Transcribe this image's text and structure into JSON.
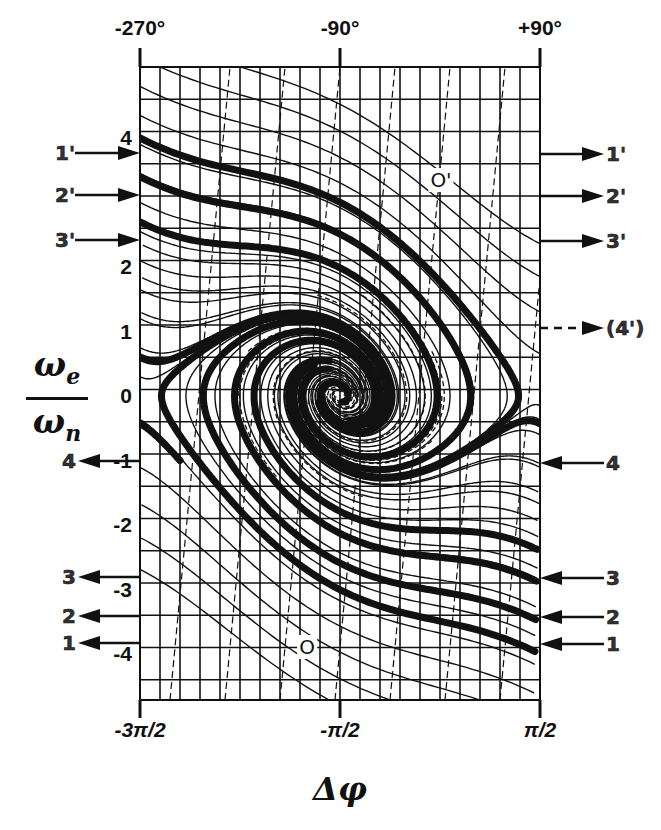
{
  "figure": {
    "y_axis_label": {
      "numerator": "ω",
      "numerator_sub": "e",
      "denominator": "ω",
      "denominator_sub": "n"
    },
    "x_axis_label": "Δφ",
    "x_ticks_top": [
      {
        "label": "-270°",
        "x": 140
      },
      {
        "label": "-90°",
        "x": 340
      },
      {
        "label": "+90°",
        "x": 540
      }
    ],
    "x_ticks_bottom": [
      {
        "label": "-3π/2",
        "x": 140
      },
      {
        "label": "-π/2",
        "x": 340
      },
      {
        "label": "π/2",
        "x": 540
      }
    ],
    "y_ticks": [
      {
        "label": "4",
        "value": 4
      },
      {
        "label": "2",
        "value": 2
      },
      {
        "label": "1",
        "value": 1
      },
      {
        "label": "0",
        "value": 0
      },
      {
        "label": "-1",
        "value": -1
      },
      {
        "label": "-2",
        "value": -2
      },
      {
        "label": "-3",
        "value": -3
      },
      {
        "label": "-4",
        "value": -4
      }
    ],
    "left_arrows": [
      {
        "label": "1'",
        "y": 153,
        "direction": "in"
      },
      {
        "label": "2'",
        "y": 195,
        "direction": "in"
      },
      {
        "label": "3'",
        "y": 240,
        "direction": "in"
      },
      {
        "label": "4",
        "y": 461,
        "direction": "out"
      },
      {
        "label": "3",
        "y": 577,
        "direction": "out"
      },
      {
        "label": "2",
        "y": 616,
        "direction": "out"
      },
      {
        "label": "1",
        "y": 643,
        "direction": "out"
      }
    ],
    "right_arrows": [
      {
        "label": "1'",
        "y": 154,
        "direction": "out",
        "dashed": false
      },
      {
        "label": "2'",
        "y": 196,
        "direction": "out",
        "dashed": false
      },
      {
        "label": "3'",
        "y": 241,
        "direction": "out",
        "dashed": false
      },
      {
        "label": "(4')",
        "y": 328,
        "direction": "out",
        "dashed": true
      },
      {
        "label": "4",
        "y": 463,
        "direction": "in",
        "dashed": false
      },
      {
        "label": "3",
        "y": 578,
        "direction": "in",
        "dashed": false
      },
      {
        "label": "2",
        "y": 617,
        "direction": "in",
        "dashed": false
      },
      {
        "label": "1",
        "y": 644,
        "direction": "in",
        "dashed": false
      }
    ],
    "point_labels": [
      {
        "label": "O'",
        "x": 441,
        "y": 180
      },
      {
        "label": "O",
        "x": 307,
        "y": 647
      }
    ],
    "plot_area": {
      "x_min_rad": "-3π/2",
      "x_max_rad": "π/2",
      "y_min": -4.8,
      "y_max": 4.8
    },
    "colors": {
      "ink": "#111111",
      "background": "#ffffff"
    }
  }
}
